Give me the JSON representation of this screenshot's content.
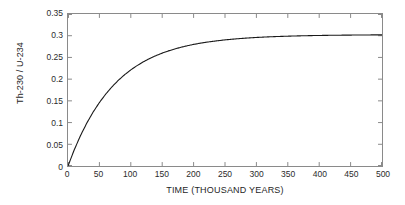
{
  "chart_data": {
    "type": "line",
    "title": "",
    "xlabel": "TIME (THOUSAND YEARS)",
    "ylabel": "Th-230 / U-234",
    "xlim": [
      0,
      500
    ],
    "ylim": [
      0,
      0.35
    ],
    "xticks": [
      0,
      50,
      100,
      150,
      200,
      250,
      300,
      350,
      400,
      450,
      500
    ],
    "xtick_labels": [
      "0",
      "50",
      "100",
      "150",
      "200",
      "250",
      "300",
      "350",
      "400",
      "450",
      "500"
    ],
    "yticks": [
      0,
      0.05,
      0.1,
      0.15,
      0.2,
      0.25,
      0.3,
      0.35
    ],
    "ytick_labels": [
      "0",
      "0.05",
      "0.1",
      "0.15",
      "0.2",
      "0.25",
      "0.3",
      "0.35"
    ],
    "grid": false,
    "legend": false,
    "box": true,
    "tick_direction": "in",
    "line_color": "#1a1a1a",
    "line_width": 1.1,
    "axis_color": "#8a8a8a",
    "background": "#ffffff",
    "series": [
      {
        "name": "Th-230 / U-234 ingrowth",
        "x": [
          0,
          10,
          20,
          30,
          40,
          50,
          60,
          70,
          80,
          90,
          100,
          110,
          120,
          130,
          140,
          150,
          160,
          170,
          180,
          190,
          200,
          210,
          220,
          230,
          240,
          250,
          260,
          270,
          280,
          290,
          300,
          310,
          320,
          330,
          340,
          350,
          360,
          370,
          380,
          390,
          400,
          410,
          420,
          430,
          440,
          450,
          460,
          470,
          480,
          490,
          500
        ],
        "y": [
          0.0,
          0.0342,
          0.0641,
          0.0903,
          0.1133,
          0.1333,
          0.1509,
          0.1663,
          0.1798,
          0.1916,
          0.2019,
          0.2109,
          0.2188,
          0.2258,
          0.2318,
          0.2371,
          0.2418,
          0.2459,
          0.2494,
          0.2526,
          0.2554,
          0.2578,
          0.2599,
          0.2618,
          0.2634,
          0.2649,
          0.2662,
          0.2673,
          0.2683,
          0.2692,
          0.27,
          0.2707,
          0.2713,
          0.2718,
          0.2723,
          0.2727,
          0.2731,
          0.2734,
          0.2737,
          0.274,
          0.2742,
          0.2744,
          0.2746,
          0.2747,
          0.2749,
          0.275,
          0.2751,
          0.2752,
          0.2753,
          0.2754,
          0.2755
        ]
      }
    ],
    "curve_model": {
      "description": "saturating exponential approach to plateau",
      "plateau": 0.302,
      "value_at_500": 0.302,
      "value_at_0": 0.0
    }
  }
}
